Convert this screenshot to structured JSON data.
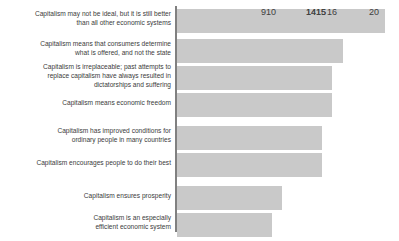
{
  "chart_data": {
    "type": "bar",
    "orientation": "horizontal",
    "title": "",
    "subtitle": "",
    "xlabel": "",
    "ylabel": "",
    "grid": false,
    "legend": null,
    "axis_color": "#808080",
    "bar_color": "#c9c9c9",
    "value_label_color": "#404040",
    "category_label_color": "#3b3b3b",
    "xlim": [
      0,
      20
    ],
    "categories": [
      "Capitalism may not be ideal, but it is still better\nthan all other economic systems",
      "Capitalism means that consumers determine\nwhat is offered, and not the state",
      "Capitalism is irreplaceable; past attempts to\nreplace capitalism have always resulted in\ndictatorships and suffering",
      "Capitalism means economic freedom",
      "Capitalism has improved conditions for\nordinary people in many countries",
      "Capitalism encourages people to do their best",
      "Capitalism ensures prosperity",
      "Capitalism is an especially\nefficient economic system"
    ],
    "values": [
      20,
      16,
      15,
      15,
      14,
      14,
      10,
      9
    ],
    "value_labels": [
      "20",
      "16",
      "15",
      "15",
      "14",
      "14",
      "10",
      "9"
    ]
  },
  "layout": {
    "bars": [
      {
        "top": 9,
        "width": 208,
        "label_top": 9,
        "label_lines": 2
      },
      {
        "top": 39,
        "width": 166,
        "label_top": 39,
        "label_lines": 2
      },
      {
        "top": 66,
        "width": 155,
        "label_top": 62,
        "label_lines": 3
      },
      {
        "top": 93,
        "width": 155,
        "label_top": 98,
        "label_lines": 1
      },
      {
        "top": 126,
        "width": 145,
        "label_top": 126,
        "label_lines": 2
      },
      {
        "top": 153,
        "width": 145,
        "label_top": 158,
        "label_lines": 1
      },
      {
        "top": 186,
        "width": 105,
        "label_top": 191,
        "label_lines": 1
      },
      {
        "top": 213,
        "width": 95,
        "label_top": 213,
        "label_lines": 2
      }
    ]
  }
}
